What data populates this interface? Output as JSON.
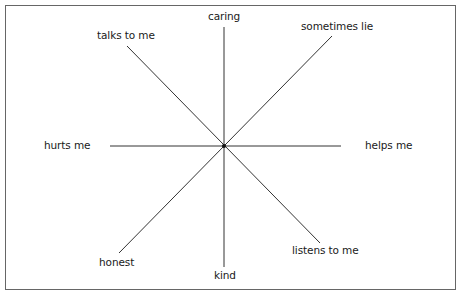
{
  "diagram": {
    "type": "radial-axes",
    "axes": [
      {
        "id": "vertical",
        "ends": [
          "caring",
          "kind"
        ]
      },
      {
        "id": "horizontal",
        "ends": [
          "hurts me",
          "helps me"
        ]
      },
      {
        "id": "diagonal-1",
        "ends": [
          "talks to me",
          "listens to me"
        ]
      },
      {
        "id": "diagonal-2",
        "ends": [
          "sometimes lie",
          "honest"
        ]
      }
    ],
    "labels": {
      "top": "caring",
      "top_right": "sometimes lie",
      "right": "helps me",
      "bottom_right": "listens to me",
      "bottom": "kind",
      "bottom_left": "honest",
      "left": "hurts me",
      "top_left": "talks to me"
    }
  }
}
